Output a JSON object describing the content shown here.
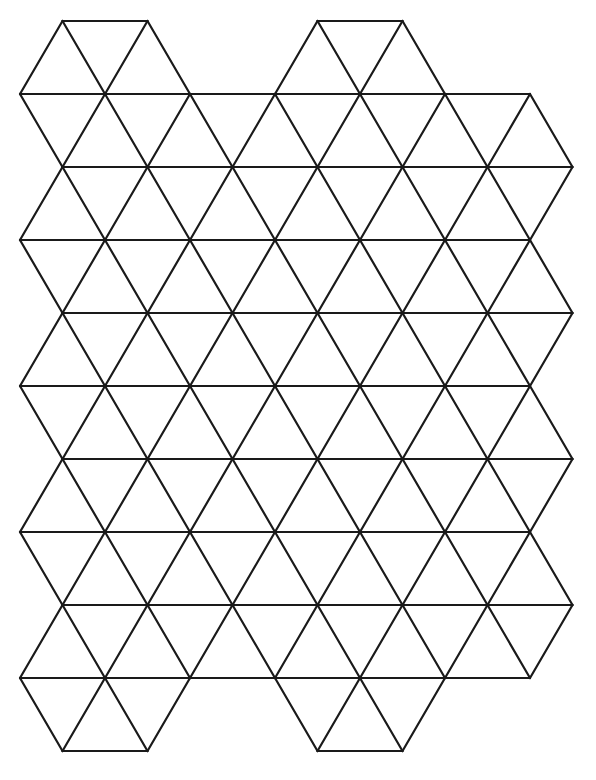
{
  "page": {
    "background_color": "#ffffff",
    "width": 596,
    "height": 780
  },
  "header": {
    "faint_text": "",
    "visible": false
  },
  "figure": {
    "name": "triangular-grid",
    "line_color": "#1a1a1a",
    "line_width": 2.2,
    "fill": "none",
    "line_cap": "round",
    "line_join": "round"
  },
  "geometry": {
    "column_spacing": 85,
    "row_spacing": 73,
    "half_column": 42.5,
    "row_y": [
      94,
      167,
      240,
      313,
      386,
      459,
      532,
      605,
      678
    ],
    "odd_row_x_start": 20,
    "odd_row_x_end": 530,
    "even_row_x_start": 62.5,
    "even_row_x_end": 572.5,
    "odd_row_vertices_x": [
      20,
      105,
      190,
      275,
      360,
      445,
      530
    ],
    "even_row_vertices_x": [
      62.5,
      147.5,
      232.5,
      317.5,
      402.5,
      487.5,
      572.5
    ],
    "top_bump_y": 21,
    "bottom_bump_y": 751,
    "bump_spans": [
      {
        "x1": 62.5,
        "x2": 147.5
      },
      {
        "x1": 317.5,
        "x2": 402.5
      }
    ],
    "triangle_rows": 9,
    "triangles_per_band": 12
  },
  "chart_data": {
    "type": "diagram",
    "subtype": "equilateral-triangle-tessellation",
    "grid": true,
    "legend": null,
    "xlabel": "",
    "ylabel": ""
  }
}
